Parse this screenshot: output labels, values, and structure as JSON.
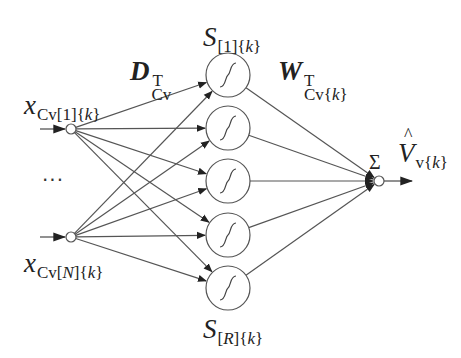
{
  "diagram": {
    "type": "neural-network",
    "labels": {
      "input_first": {
        "base": "x",
        "sub_pre": "Cv[1]{",
        "sub_var": "k",
        "sub_post": "}"
      },
      "input_last": {
        "base": "x",
        "sub_pre": "Cv[",
        "sub_var_n": "N",
        "sub_mid": "]{",
        "sub_var": "k",
        "sub_post": "}"
      },
      "ellipsis": "···",
      "input_weights": {
        "base": "D",
        "sub": "Cv",
        "sup": "T"
      },
      "hidden_first": {
        "base": "S",
        "sub_pre": "[1]{",
        "sub_var": "k",
        "sub_post": "}"
      },
      "hidden_last": {
        "base": "S",
        "sub_pre": "[",
        "sub_var_n": "R",
        "sub_mid": "]{",
        "sub_var": "k",
        "sub_post": "}"
      },
      "output_weights": {
        "base": "W",
        "sub_pre": "Cv{",
        "sub_var": "k",
        "sub_post": "}",
        "sup": "T"
      },
      "sum": "Σ",
      "output": {
        "base": "V",
        "hat": "^",
        "sub_pre": "v{",
        "sub_var": "k",
        "sub_post": "}"
      }
    },
    "nodes": {
      "inputs": [
        {
          "id": "x1",
          "cx": 71,
          "cy": 129,
          "r": 5
        },
        {
          "id": "xN",
          "cx": 71,
          "cy": 237,
          "r": 5
        }
      ],
      "hidden": [
        {
          "id": "S1",
          "cx": 228,
          "cy": 75,
          "r": 22
        },
        {
          "id": "S2",
          "cx": 228,
          "cy": 128,
          "r": 22
        },
        {
          "id": "S3",
          "cx": 228,
          "cy": 181,
          "r": 22
        },
        {
          "id": "S4",
          "cx": 228,
          "cy": 235,
          "r": 22
        },
        {
          "id": "SR",
          "cx": 228,
          "cy": 288,
          "r": 22
        }
      ],
      "sum": {
        "id": "sum",
        "cx": 379,
        "cy": 181,
        "r": 5
      }
    },
    "colors": {
      "line": "#555555",
      "arrow": "#222222",
      "node_stroke": "#555555",
      "text": "#222222"
    }
  }
}
